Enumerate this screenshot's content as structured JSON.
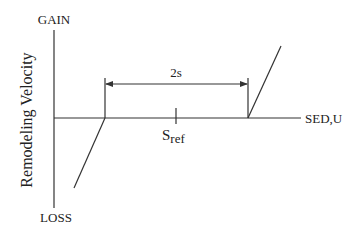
{
  "diagram": {
    "y_axis": {
      "label": "Remodeling Velocity",
      "top_label": "GAIN",
      "bottom_label": "LOSS"
    },
    "x_axis": {
      "label": "SED,U"
    },
    "reference": {
      "label_main": "S",
      "label_sub": "ref"
    },
    "dead_zone": {
      "width_label": "2s"
    },
    "colors": {
      "line": "#333333",
      "text": "#222222",
      "background": "#ffffff"
    }
  }
}
